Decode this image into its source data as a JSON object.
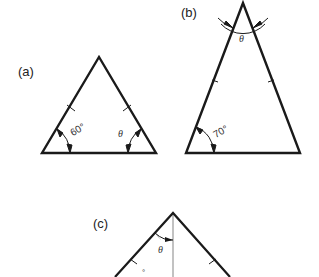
{
  "figures": [
    {
      "id": "a",
      "label": "(a)",
      "angles": {
        "base_left": "60°",
        "base_right": "θ"
      }
    },
    {
      "id": "b",
      "label": "(b)",
      "angles": {
        "apex": "θ",
        "base_left": "70°"
      }
    },
    {
      "id": "c",
      "label": "(c)",
      "angles": {
        "apex_half": "θ",
        "lower": "°"
      }
    }
  ],
  "colors": {
    "stroke": "#1a1a1a",
    "altitude": "#999999"
  }
}
